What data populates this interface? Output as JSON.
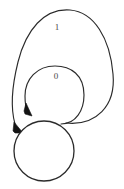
{
  "diagram": {
    "type": "finite-state-automaton",
    "background_color": "#ffffff",
    "stroke_color": "#2b2b2b",
    "label_color": "#4a4a4a",
    "states": [
      {
        "id": "q0",
        "label": "",
        "shape": "circle",
        "center": {
          "x": 44,
          "y": 151
        },
        "radius": 30,
        "accepting": false
      }
    ],
    "transitions": [
      {
        "id": "loop-0",
        "from": "q0",
        "to": "q0",
        "label": "0",
        "label_position": {
          "x": 56,
          "y": 77
        },
        "kind": "self-loop",
        "size": "inner",
        "arrow_tip": {
          "x": 30,
          "y": 113
        }
      },
      {
        "id": "loop-1",
        "from": "q0",
        "to": "q0",
        "label": "1",
        "label_position": {
          "x": 57,
          "y": 28
        },
        "kind": "self-loop",
        "size": "outer",
        "arrow_tip": {
          "x": 18,
          "y": 131
        }
      }
    ],
    "labels": {
      "loop_zero": "0",
      "loop_one": "1"
    }
  }
}
